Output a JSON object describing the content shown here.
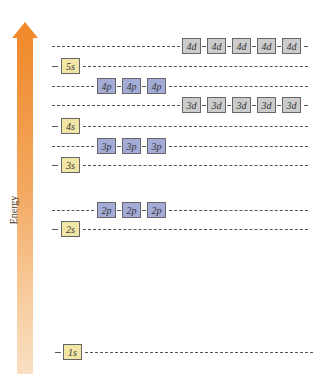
{
  "axis": {
    "label": "Energy",
    "arrow_color": "#f08a2c"
  },
  "colors": {
    "s": "#f1e6a6",
    "p": "#a3acd6",
    "d": "#cccccc"
  },
  "levels": [
    {
      "name": "4d",
      "type": "d",
      "count": 5,
      "y": 38,
      "labels": [
        "4d",
        "4d",
        "4d",
        "4d",
        "4d"
      ]
    },
    {
      "name": "5s",
      "type": "s",
      "count": 1,
      "y": 58,
      "labels": [
        "5s"
      ]
    },
    {
      "name": "4p",
      "type": "p",
      "count": 3,
      "y": 78,
      "labels": [
        "4p",
        "4p",
        "4p"
      ]
    },
    {
      "name": "3d",
      "type": "d",
      "count": 5,
      "y": 97,
      "labels": [
        "3d",
        "3d",
        "3d",
        "3d",
        "3d"
      ]
    },
    {
      "name": "4s",
      "type": "s",
      "count": 1,
      "y": 118,
      "labels": [
        "4s"
      ]
    },
    {
      "name": "3p",
      "type": "p",
      "count": 3,
      "y": 138,
      "labels": [
        "3p",
        "3p",
        "3p"
      ]
    },
    {
      "name": "3s",
      "type": "s",
      "count": 1,
      "y": 157,
      "labels": [
        "3s"
      ]
    },
    {
      "name": "2p",
      "type": "p",
      "count": 3,
      "y": 202,
      "labels": [
        "2p",
        "2p",
        "2p"
      ]
    },
    {
      "name": "2s",
      "type": "s",
      "count": 1,
      "y": 221,
      "labels": [
        "2s"
      ]
    },
    {
      "name": "1s",
      "type": "s",
      "count": 1,
      "y": 344,
      "labels": [
        "1s"
      ]
    }
  ]
}
